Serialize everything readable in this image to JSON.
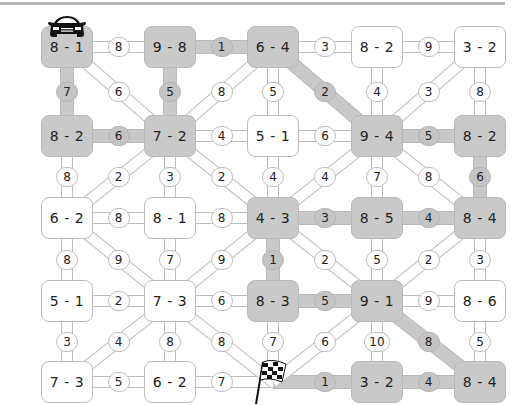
{
  "icons": {
    "start": "race-car-icon",
    "finish": "checkered-flag-icon"
  },
  "colors": {
    "path_highlight": "#c9c9c9",
    "node_default": "#ffffff",
    "border": "#bdbdbd",
    "text": "#222222"
  },
  "grid": {
    "col_x": [
      67,
      170,
      273,
      377,
      480
    ],
    "row_y": [
      47,
      136,
      218,
      301,
      382
    ]
  },
  "nodes": [
    [
      {
        "label": "8 - 1",
        "hl": true
      },
      {
        "label": "9 - 8",
        "hl": true
      },
      {
        "label": "6 - 4",
        "hl": true
      },
      {
        "label": "8 - 2",
        "hl": false
      },
      {
        "label": "3 - 2",
        "hl": false
      }
    ],
    [
      {
        "label": "8 - 2",
        "hl": true
      },
      {
        "label": "7 - 2",
        "hl": true
      },
      {
        "label": "5 - 1",
        "hl": false
      },
      {
        "label": "9 - 4",
        "hl": true
      },
      {
        "label": "8 - 2",
        "hl": true
      }
    ],
    [
      {
        "label": "6 - 2",
        "hl": false
      },
      {
        "label": "8 - 1",
        "hl": false
      },
      {
        "label": "4 - 3",
        "hl": true
      },
      {
        "label": "8 - 5",
        "hl": true
      },
      {
        "label": "8 - 4",
        "hl": true
      }
    ],
    [
      {
        "label": "5 - 1",
        "hl": false
      },
      {
        "label": "7 - 3",
        "hl": false
      },
      {
        "label": "8 - 3",
        "hl": true
      },
      {
        "label": "9 - 1",
        "hl": true
      },
      {
        "label": "8 - 6",
        "hl": false
      }
    ],
    [
      {
        "label": "7 - 3",
        "hl": false
      },
      {
        "label": "6 - 2",
        "hl": false
      },
      {
        "label": "",
        "hl": false,
        "finish": true
      },
      {
        "label": "3 - 2",
        "hl": true
      },
      {
        "label": "8 - 4",
        "hl": true
      }
    ]
  ],
  "h_edges": [
    [
      {
        "v": "8",
        "hl": false
      },
      {
        "v": "1",
        "hl": true
      },
      {
        "v": "3",
        "hl": false
      },
      {
        "v": "9",
        "hl": false
      }
    ],
    [
      {
        "v": "6",
        "hl": true
      },
      {
        "v": "4",
        "hl": false
      },
      {
        "v": "6",
        "hl": false
      },
      {
        "v": "5",
        "hl": true
      }
    ],
    [
      {
        "v": "8",
        "hl": false
      },
      {
        "v": "8",
        "hl": false
      },
      {
        "v": "3",
        "hl": true
      },
      {
        "v": "4",
        "hl": true
      }
    ],
    [
      {
        "v": "2",
        "hl": false
      },
      {
        "v": "6",
        "hl": false
      },
      {
        "v": "5",
        "hl": true
      },
      {
        "v": "9",
        "hl": false
      }
    ],
    [
      {
        "v": "5",
        "hl": false
      },
      {
        "v": "7",
        "hl": false
      },
      {
        "v": "1",
        "hl": true
      },
      {
        "v": "4",
        "hl": true
      }
    ]
  ],
  "v_edges": [
    [
      {
        "v": "7",
        "hl": true
      },
      {
        "v": "5",
        "hl": true
      },
      {
        "v": "5",
        "hl": false
      },
      {
        "v": "4",
        "hl": false
      },
      {
        "v": "8",
        "hl": false
      }
    ],
    [
      {
        "v": "8",
        "hl": false
      },
      {
        "v": "3",
        "hl": false
      },
      {
        "v": "4",
        "hl": false
      },
      {
        "v": "7",
        "hl": false
      },
      {
        "v": "6",
        "hl": true
      }
    ],
    [
      {
        "v": "8",
        "hl": false
      },
      {
        "v": "7",
        "hl": false
      },
      {
        "v": "1",
        "hl": true
      },
      {
        "v": "5",
        "hl": false
      },
      {
        "v": "3",
        "hl": false
      }
    ],
    [
      {
        "v": "3",
        "hl": false
      },
      {
        "v": "8",
        "hl": false
      },
      {
        "v": "7",
        "hl": false
      },
      {
        "v": "10",
        "hl": false
      },
      {
        "v": "5",
        "hl": false
      }
    ]
  ],
  "d_edges": [
    [
      {
        "v": "6",
        "dir": "\\",
        "hl": false
      },
      {
        "v": "8",
        "dir": "/",
        "hl": false
      },
      {
        "v": "2",
        "dir": "\\",
        "hl": true
      },
      {
        "v": "3",
        "dir": "/",
        "hl": false
      }
    ],
    [
      {
        "v": "2",
        "dir": "/",
        "hl": false
      },
      {
        "v": "2",
        "dir": "\\",
        "hl": false
      },
      {
        "v": "4",
        "dir": "/",
        "hl": false
      },
      {
        "v": "8",
        "dir": "\\",
        "hl": false
      }
    ],
    [
      {
        "v": "9",
        "dir": "\\",
        "hl": false
      },
      {
        "v": "9",
        "dir": "/",
        "hl": false
      },
      {
        "v": "2",
        "dir": "\\",
        "hl": false
      },
      {
        "v": "2",
        "dir": "/",
        "hl": false
      }
    ],
    [
      {
        "v": "4",
        "dir": "/",
        "hl": false
      },
      {
        "v": "8",
        "dir": "\\",
        "hl": false
      },
      {
        "v": "6",
        "dir": "/",
        "hl": false
      },
      {
        "v": "8",
        "dir": "\\",
        "hl": true
      }
    ]
  ]
}
